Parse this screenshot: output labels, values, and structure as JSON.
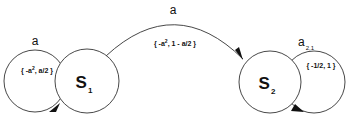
{
  "diagram": {
    "type": "state-transition",
    "stroke_color": "#333333",
    "states": [
      {
        "id": "s1",
        "label": "S",
        "subscript": "1"
      },
      {
        "id": "s2",
        "label": "S",
        "subscript": "2"
      }
    ],
    "transitions": [
      {
        "id": "t-s1-self",
        "from": "s1",
        "to": "s1",
        "label": "a",
        "guard_prefix": "{ -a",
        "guard_sup": "2",
        "guard_suffix": ", a/2 }"
      },
      {
        "id": "t-s1-s2",
        "from": "s1",
        "to": "s2",
        "label": "a",
        "guard_prefix": "{ -a",
        "guard_sup": "2",
        "guard_suffix": ", 1 - a/2 }"
      },
      {
        "id": "t-s2-self",
        "from": "s2",
        "to": "s2",
        "label": "a",
        "label_subscript": "2,1",
        "guard": "{ -1/2, 1 }"
      }
    ]
  }
}
